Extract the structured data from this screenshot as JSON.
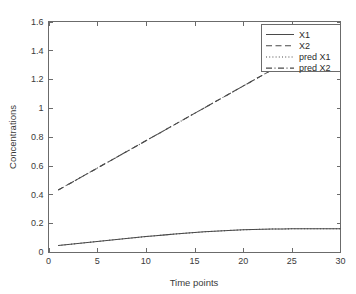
{
  "chart_data": {
    "type": "line",
    "title": "",
    "xlabel": "Time points",
    "ylabel": "Concentrations",
    "xlim": [
      0,
      30
    ],
    "ylim": [
      0,
      1.6
    ],
    "grid": false,
    "legend_position": "top-right",
    "xticks": [
      0,
      5,
      10,
      15,
      20,
      25,
      30
    ],
    "xtick_labels": [
      "0",
      "5",
      "10",
      "15",
      "20",
      "25",
      "30"
    ],
    "yticks": [
      0,
      0.2,
      0.4,
      0.6,
      0.8,
      1,
      1.2,
      1.4,
      1.6
    ],
    "ytick_labels": [
      "0",
      "0.2",
      "0.4",
      "0.6",
      "0.8",
      "1",
      "1.2",
      "1.4",
      "1.6"
    ],
    "series": [
      {
        "name": "X1",
        "style": "solid",
        "color": "#4a4a4a",
        "x": [
          1,
          2,
          3,
          4,
          5,
          6,
          7,
          8,
          9,
          10,
          11,
          12,
          13,
          14,
          15,
          16,
          17,
          18,
          19,
          20,
          21,
          22,
          23,
          24,
          25,
          26,
          27,
          28,
          29,
          30
        ],
        "values": [
          0.045,
          0.052,
          0.059,
          0.066,
          0.073,
          0.08,
          0.087,
          0.094,
          0.1,
          0.107,
          0.113,
          0.119,
          0.125,
          0.13,
          0.135,
          0.14,
          0.144,
          0.148,
          0.151,
          0.154,
          0.156,
          0.158,
          0.159,
          0.16,
          0.161,
          0.161,
          0.161,
          0.161,
          0.161,
          0.161
        ]
      },
      {
        "name": "X2",
        "style": "dashed",
        "color": "#4a4a4a",
        "x": [
          1,
          2,
          3,
          4,
          5,
          6,
          7,
          8,
          9,
          10,
          11,
          12,
          13,
          14,
          15,
          16,
          17,
          18,
          19,
          20,
          21,
          22,
          23,
          24,
          25,
          26,
          27,
          28,
          29,
          30
        ],
        "values": [
          0.43,
          0.468,
          0.506,
          0.544,
          0.582,
          0.62,
          0.658,
          0.696,
          0.734,
          0.772,
          0.81,
          0.848,
          0.886,
          0.924,
          0.962,
          1.0,
          1.038,
          1.076,
          1.114,
          1.152,
          1.19,
          1.228,
          1.266,
          1.304,
          1.342,
          1.38,
          1.418,
          1.456,
          1.494,
          1.532
        ]
      },
      {
        "name": "pred X1",
        "style": "dotted",
        "color": "#4a4a4a",
        "x": [
          1,
          2,
          3,
          4,
          5,
          6,
          7,
          8,
          9,
          10,
          11,
          12,
          13,
          14,
          15,
          16,
          17,
          18,
          19,
          20,
          21,
          22,
          23,
          24,
          25,
          26,
          27,
          28,
          29,
          30
        ],
        "values": [
          0.045,
          0.052,
          0.059,
          0.066,
          0.073,
          0.08,
          0.087,
          0.094,
          0.1,
          0.107,
          0.113,
          0.119,
          0.125,
          0.13,
          0.135,
          0.14,
          0.144,
          0.148,
          0.151,
          0.154,
          0.156,
          0.158,
          0.159,
          0.16,
          0.161,
          0.161,
          0.161,
          0.161,
          0.161,
          0.161
        ]
      },
      {
        "name": "pred X2",
        "style": "dashdot",
        "color": "#4a4a4a",
        "x": [
          1,
          2,
          3,
          4,
          5,
          6,
          7,
          8,
          9,
          10,
          11,
          12,
          13,
          14,
          15,
          16,
          17,
          18,
          19,
          20,
          21,
          22,
          23,
          24,
          25,
          26,
          27,
          28,
          29,
          30
        ],
        "values": [
          0.43,
          0.468,
          0.506,
          0.544,
          0.582,
          0.62,
          0.658,
          0.696,
          0.734,
          0.772,
          0.81,
          0.848,
          0.886,
          0.924,
          0.962,
          1.0,
          1.038,
          1.076,
          1.114,
          1.152,
          1.19,
          1.228,
          1.266,
          1.304,
          1.342,
          1.38,
          1.418,
          1.456,
          1.494,
          1.532
        ]
      }
    ]
  },
  "legend": {
    "entries": [
      {
        "label": "X1",
        "style": "solid"
      },
      {
        "label": "X2",
        "style": "dashed"
      },
      {
        "label": "pred X1",
        "style": "dotted"
      },
      {
        "label": "pred X2",
        "style": "dashdot"
      }
    ]
  },
  "colors": {
    "line": "#4a4a4a",
    "axis": "#6b6b6b",
    "text": "#3a3a3a",
    "background": "#ffffff"
  }
}
